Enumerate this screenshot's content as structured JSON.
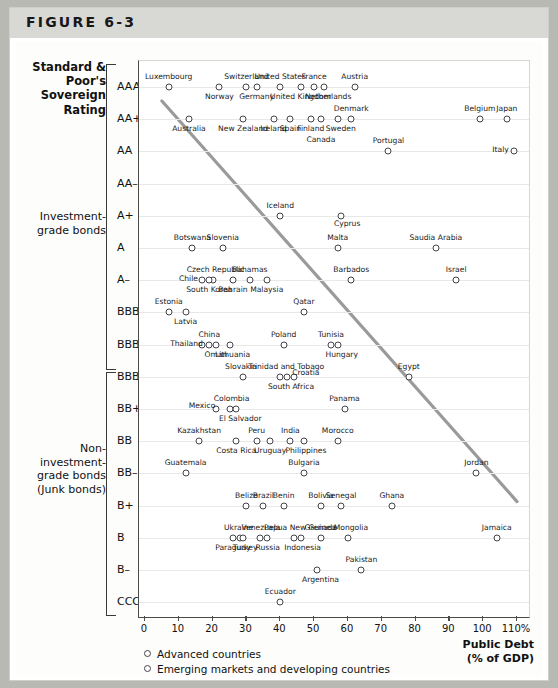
{
  "figure": {
    "label": "FIGURE 6-3"
  },
  "yaxis": {
    "title": "Standard &\nPoor's\nSovereign\nRating",
    "title_lines": [
      "Standard &",
      "Poor's",
      "Sovereign",
      "Rating"
    ],
    "ticks": [
      "AAA",
      "AA+",
      "AA",
      "AA–",
      "A+",
      "A",
      "A–",
      "BBB+",
      "BBB",
      "BBB–",
      "BB+",
      "BB",
      "BB–",
      "B+",
      "B",
      "B–",
      "CCC+"
    ],
    "group_investment": "Investment-\ngrade bonds",
    "group_investment_lines": [
      "Investment-",
      "grade bonds"
    ],
    "group_junk": "Non-\ninvestment-\ngrade bonds\n(Junk bonds)",
    "group_junk_lines": [
      "Non-",
      "investment-",
      "grade bonds",
      "(Junk bonds)"
    ]
  },
  "xaxis": {
    "ticks": [
      "0",
      "10",
      "20",
      "30",
      "40",
      "50",
      "60",
      "70",
      "80",
      "90",
      "100",
      "110%"
    ],
    "title_lines": [
      "Public Debt",
      "(% of GDP)"
    ],
    "title": "Public Debt (% of GDP)"
  },
  "legend": {
    "items": [
      {
        "label": "Advanced countries",
        "marker": "open-circle"
      },
      {
        "label": "Emerging markets and developing countries",
        "marker": "open-circle"
      }
    ]
  },
  "chart_data": {
    "type": "scatter",
    "title": "FIGURE 6-3",
    "xlabel": "Public Debt (% of GDP)",
    "ylabel": "Standard & Poor's Sovereign Rating",
    "xlim": [
      0,
      110
    ],
    "grid": true,
    "legend_position": "bottom-left",
    "y_categories": [
      "AAA",
      "AA+",
      "AA",
      "AA–",
      "A+",
      "A",
      "A–",
      "BBB+",
      "BBB",
      "BBB–",
      "BB+",
      "BB",
      "BB–",
      "B+",
      "B",
      "B–",
      "CCC+"
    ],
    "trendline": {
      "x_start": 6,
      "y_start": "AAA/AA+ boundary",
      "x_end": 110,
      "y_end": "B+",
      "note": "downward sloping fitted line",
      "color": "#8e8e8e"
    },
    "points": [
      {
        "name": "Luxembourg",
        "x": 7,
        "rating": "AAA",
        "lx": 0,
        "ly": -11
      },
      {
        "name": "Switzerland",
        "x": 30,
        "rating": "AAA",
        "lx": 0,
        "ly": -11
      },
      {
        "name": "Norway",
        "x": 22,
        "rating": "AAA",
        "lx": 0,
        "ly": 9
      },
      {
        "name": "Germany",
        "x": 33,
        "rating": "AAA",
        "lx": 0,
        "ly": 9
      },
      {
        "name": "United States",
        "x": 40,
        "rating": "AAA",
        "lx": 0,
        "ly": -11
      },
      {
        "name": "United Kingdom",
        "x": 46,
        "rating": "AAA",
        "lx": 0,
        "ly": 9
      },
      {
        "name": "France",
        "x": 50,
        "rating": "AAA",
        "lx": 0,
        "ly": -11
      },
      {
        "name": "Netherlands",
        "x": 53,
        "rating": "AAA",
        "lx": 4,
        "ly": 9
      },
      {
        "name": "Austria",
        "x": 62,
        "rating": "AAA",
        "lx": 0,
        "ly": -11
      },
      {
        "name": "Denmark",
        "x": 61,
        "rating": "AA+",
        "lx": 0,
        "ly": -11
      },
      {
        "name": "Australia",
        "x": 13,
        "rating": "AA+",
        "lx": 0,
        "ly": 9
      },
      {
        "name": "New Zealand",
        "x": 29,
        "rating": "AA+",
        "lx": 0,
        "ly": 9
      },
      {
        "name": "Ireland",
        "x": 38,
        "rating": "AA+",
        "lx": 0,
        "ly": 9
      },
      {
        "name": "Spain",
        "x": 43,
        "rating": "AA+",
        "lx": 0,
        "ly": 9
      },
      {
        "name": "Finland",
        "x": 49,
        "rating": "AA+",
        "lx": 0,
        "ly": 9
      },
      {
        "name": "Canada",
        "x": 52,
        "rating": "AA+",
        "lx": 0,
        "ly": 20
      },
      {
        "name": "Sweden",
        "x": 57,
        "rating": "AA+",
        "lx": 3,
        "ly": 9
      },
      {
        "name": "Belgium",
        "x": 99,
        "rating": "AA+",
        "lx": 0,
        "ly": -11
      },
      {
        "name": "Japan",
        "x": 107,
        "rating": "AA+",
        "lx": 0,
        "ly": -11
      },
      {
        "name": "Portugal",
        "x": 72,
        "rating": "AA",
        "lx": 0,
        "ly": -11
      },
      {
        "name": "Italy",
        "x": 109,
        "rating": "AA",
        "lx": -13,
        "ly": -2
      },
      {
        "name": "Iceland",
        "x": 40,
        "rating": "A+",
        "lx": 0,
        "ly": -11
      },
      {
        "name": "Cyprus",
        "x": 58,
        "rating": "A+",
        "lx": 6,
        "ly": 7
      },
      {
        "name": "Botswana",
        "x": 14,
        "rating": "A",
        "lx": 0,
        "ly": -11
      },
      {
        "name": "Slovenia",
        "x": 23,
        "rating": "A",
        "lx": 0,
        "ly": -11
      },
      {
        "name": "Malta",
        "x": 57,
        "rating": "A",
        "lx": 0,
        "ly": -11
      },
      {
        "name": "Saudia Arabia",
        "x": 86,
        "rating": "A",
        "lx": 0,
        "ly": -11
      },
      {
        "name": "Chile",
        "x": 17,
        "rating": "A–",
        "lx": -14,
        "ly": -2
      },
      {
        "name": "Czech Republic",
        "x": 20,
        "rating": "A–",
        "lx": 3,
        "ly": -11
      },
      {
        "name": "South Korea",
        "x": 19,
        "rating": "A–",
        "lx": 0,
        "ly": 9
      },
      {
        "name": "Bahrain",
        "x": 26,
        "rating": "A–",
        "lx": 0,
        "ly": 9
      },
      {
        "name": "Bahamas",
        "x": 31,
        "rating": "A–",
        "lx": 0,
        "ly": -11
      },
      {
        "name": "Malaysia",
        "x": 36,
        "rating": "A–",
        "lx": 0,
        "ly": 9
      },
      {
        "name": "Barbados",
        "x": 61,
        "rating": "A–",
        "lx": 0,
        "ly": -11
      },
      {
        "name": "Israel",
        "x": 92,
        "rating": "A–",
        "lx": 0,
        "ly": -11
      },
      {
        "name": "Estonia",
        "x": 7,
        "rating": "BBB+",
        "lx": 0,
        "ly": -11
      },
      {
        "name": "Latvia",
        "x": 12,
        "rating": "BBB+",
        "lx": 0,
        "ly": 9
      },
      {
        "name": "Qatar",
        "x": 47,
        "rating": "BBB+",
        "lx": 0,
        "ly": -11
      },
      {
        "name": "Thailand",
        "x": 17,
        "rating": "BBB",
        "lx": -16,
        "ly": -2
      },
      {
        "name": "China",
        "x": 19,
        "rating": "BBB",
        "lx": 0,
        "ly": -11
      },
      {
        "name": "Oman",
        "x": 21,
        "rating": "BBB",
        "lx": 0,
        "ly": 9
      },
      {
        "name": "Lithuania",
        "x": 25,
        "rating": "BBB",
        "lx": 3,
        "ly": 9
      },
      {
        "name": "Poland",
        "x": 41,
        "rating": "BBB",
        "lx": 0,
        "ly": -11
      },
      {
        "name": "Tunisia",
        "x": 55,
        "rating": "BBB",
        "lx": 0,
        "ly": -11
      },
      {
        "name": "Hungary",
        "x": 57,
        "rating": "BBB",
        "lx": 4,
        "ly": 9
      },
      {
        "name": "Slovakia",
        "x": 29,
        "rating": "BBB–",
        "lx": -2,
        "ly": -11
      },
      {
        "name": "Trinidad and Tobago",
        "x": 40,
        "rating": "BBB–",
        "lx": 6,
        "ly": -11
      },
      {
        "name": "Croatia",
        "x": 44,
        "rating": "BBB–",
        "lx": 12,
        "ly": -5
      },
      {
        "name": "South Africa",
        "x": 42,
        "rating": "BBB–",
        "lx": 4,
        "ly": 9
      },
      {
        "name": "Egypt",
        "x": 78,
        "rating": "BBB–",
        "lx": 0,
        "ly": -11
      },
      {
        "name": "Mexico",
        "x": 21,
        "rating": "BB+",
        "lx": -14,
        "ly": -4
      },
      {
        "name": "Colombia",
        "x": 25,
        "rating": "BB+",
        "lx": 2,
        "ly": -11
      },
      {
        "name": "El Salvador",
        "x": 27,
        "rating": "BB+",
        "lx": 4,
        "ly": 9
      },
      {
        "name": "Panama",
        "x": 59,
        "rating": "BB+",
        "lx": 0,
        "ly": -11
      },
      {
        "name": "Kazakhstan",
        "x": 16,
        "rating": "BB",
        "lx": 0,
        "ly": -11
      },
      {
        "name": "Costa Rica",
        "x": 27,
        "rating": "BB",
        "lx": 0,
        "ly": 9
      },
      {
        "name": "Peru",
        "x": 33,
        "rating": "BB",
        "lx": 0,
        "ly": -11
      },
      {
        "name": "Uruguay",
        "x": 37,
        "rating": "BB",
        "lx": 0,
        "ly": 9
      },
      {
        "name": "India",
        "x": 43,
        "rating": "BB",
        "lx": 0,
        "ly": -11
      },
      {
        "name": "Philippines",
        "x": 47,
        "rating": "BB",
        "lx": 2,
        "ly": 9
      },
      {
        "name": "Morocco",
        "x": 57,
        "rating": "BB",
        "lx": 0,
        "ly": -11
      },
      {
        "name": "Guatemala",
        "x": 12,
        "rating": "BB–",
        "lx": 0,
        "ly": -11
      },
      {
        "name": "Bulgaria",
        "x": 47,
        "rating": "BB–",
        "lx": 0,
        "ly": -11
      },
      {
        "name": "Jordan",
        "x": 98,
        "rating": "BB–",
        "lx": 0,
        "ly": -11
      },
      {
        "name": "Belize",
        "x": 30,
        "rating": "B+",
        "lx": 0,
        "ly": -11
      },
      {
        "name": "Brazil",
        "x": 35,
        "rating": "B+",
        "lx": 0,
        "ly": -11
      },
      {
        "name": "Benin",
        "x": 41,
        "rating": "B+",
        "lx": 0,
        "ly": -11
      },
      {
        "name": "Bolivia",
        "x": 52,
        "rating": "B+",
        "lx": 0,
        "ly": -11
      },
      {
        "name": "Senegal",
        "x": 58,
        "rating": "B+",
        "lx": 0,
        "ly": -11
      },
      {
        "name": "Ghana",
        "x": 73,
        "rating": "B+",
        "lx": 0,
        "ly": -11
      },
      {
        "name": "Paraguay",
        "x": 26,
        "rating": "B",
        "lx": 0,
        "ly": 9
      },
      {
        "name": "Ukraine",
        "x": 28,
        "rating": "B",
        "lx": -1,
        "ly": -11
      },
      {
        "name": "Turkey",
        "x": 29,
        "rating": "B",
        "lx": 2,
        "ly": 9
      },
      {
        "name": "Venezuela",
        "x": 34,
        "rating": "B",
        "lx": 1,
        "ly": -11
      },
      {
        "name": "Russia",
        "x": 36,
        "rating": "B",
        "lx": 1,
        "ly": 9
      },
      {
        "name": "Papua New Guinea",
        "x": 44,
        "rating": "B",
        "lx": 6,
        "ly": -11
      },
      {
        "name": "Indonesia",
        "x": 46,
        "rating": "B",
        "lx": 2,
        "ly": 9
      },
      {
        "name": "Grenada",
        "x": 52,
        "rating": "B",
        "lx": 0,
        "ly": -11
      },
      {
        "name": "Mongolia",
        "x": 60,
        "rating": "B",
        "lx": 3,
        "ly": -11
      },
      {
        "name": "Jamaica",
        "x": 104,
        "rating": "B",
        "lx": 0,
        "ly": -11
      },
      {
        "name": "Argentina",
        "x": 51,
        "rating": "B–",
        "lx": 3,
        "ly": 9
      },
      {
        "name": "Pakistan",
        "x": 64,
        "rating": "B–",
        "lx": 0,
        "ly": -11
      },
      {
        "name": "Ecuador",
        "x": 40,
        "rating": "CCC+",
        "lx": 0,
        "ly": -11
      }
    ]
  }
}
